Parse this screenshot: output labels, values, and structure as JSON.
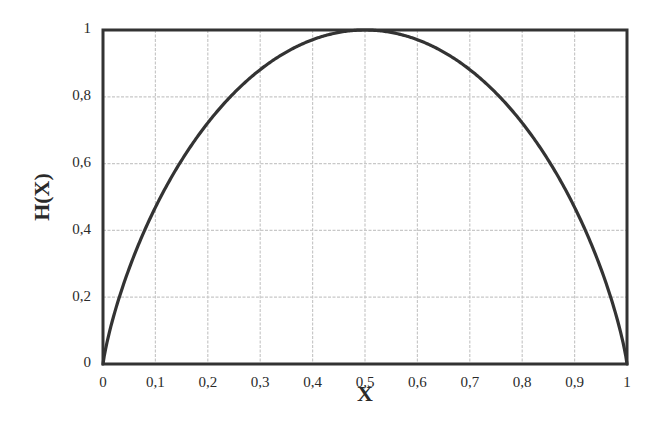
{
  "chart_data": {
    "type": "line",
    "title": "",
    "xlabel": "X",
    "ylabel": "H(X)",
    "xlim": [
      0,
      1
    ],
    "ylim": [
      0,
      1
    ],
    "grid": true,
    "legend": null,
    "x_ticks": [
      "0",
      "0,1",
      "0,2",
      "0,3",
      "0,4",
      "0,5",
      "0,6",
      "0,7",
      "0,8",
      "0,9",
      "1"
    ],
    "y_ticks": [
      "0",
      "0,2",
      "0,4",
      "0,6",
      "0,8",
      "1"
    ],
    "series": [
      {
        "name": "H(X) binary entropy",
        "x": [
          0,
          0.01,
          0.02,
          0.05,
          0.1,
          0.15,
          0.2,
          0.25,
          0.3,
          0.35,
          0.4,
          0.45,
          0.5,
          0.55,
          0.6,
          0.65,
          0.7,
          0.75,
          0.8,
          0.85,
          0.9,
          0.95,
          0.98,
          0.99,
          1
        ],
        "values": [
          0,
          0.081,
          0.141,
          0.286,
          0.469,
          0.61,
          0.722,
          0.811,
          0.881,
          0.934,
          0.971,
          0.993,
          1.0,
          0.993,
          0.971,
          0.934,
          0.881,
          0.811,
          0.722,
          0.61,
          0.469,
          0.286,
          0.141,
          0.081,
          0
        ]
      }
    ],
    "colors": {
      "line": "#333333",
      "frame": "#333333",
      "grid": "#c8c8c8",
      "text": "#2a2a2a"
    }
  }
}
